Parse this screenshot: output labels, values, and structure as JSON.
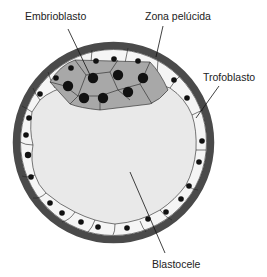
{
  "diagram": {
    "labels": {
      "embrioblasto": "Embrioblasto",
      "zona_pelucida": "Zona pelúcida",
      "trofoblasto": "Trofoblasto",
      "blastocele": "Blastocele"
    },
    "colors": {
      "zona_pelucida": "#4a4a4a",
      "trophoblast_cells": "#f4f4f4",
      "embryoblast_cells": "#a8a8a8",
      "blastocele": "#e9e9e9",
      "nuclei": "#111111"
    }
  }
}
